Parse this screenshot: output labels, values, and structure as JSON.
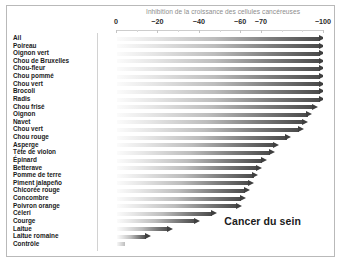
{
  "chart_data": {
    "type": "bar",
    "title": "Inhibition de la croissance des cellules cancéreuses",
    "annotation": "Cancer du sein",
    "xlabel": "",
    "ylabel": "",
    "orientation": "horizontal",
    "grid": false,
    "legend": "none",
    "xlim": [
      0,
      -100
    ],
    "tick_labels": [
      "0",
      "−20",
      "−40",
      "−60",
      "−70",
      "−100"
    ],
    "tick_values": [
      0,
      -20,
      -40,
      -60,
      -70,
      -100
    ],
    "categories": [
      "Ail",
      "Poireau",
      "Oignon vert",
      "Chou de Bruxelles",
      "Chou-fleur",
      "Chou pommé",
      "Chou vert",
      "Brocoli",
      "Radis",
      "Chou frisé",
      "Oignon",
      "Navet",
      "Chou vert",
      "Chou rouge",
      "Asperge",
      "Tête de violon",
      "Épinard",
      "Betterave",
      "Pomme de terre",
      "Piment jalapeño",
      "Chicorée rouge",
      "Concombre",
      "Poivron orange",
      "Céleri",
      "Courge",
      "Laitue",
      "Laitue romaine",
      "Contrôle"
    ],
    "values": [
      -100,
      -100,
      -100,
      -100,
      -100,
      -100,
      -100,
      -100,
      -100,
      -97,
      -94,
      -92,
      -90,
      -84,
      -78,
      -76,
      -72,
      -70,
      -68,
      -66,
      -64,
      -62,
      -60,
      -48,
      -40,
      -27,
      -16,
      -4
    ]
  }
}
